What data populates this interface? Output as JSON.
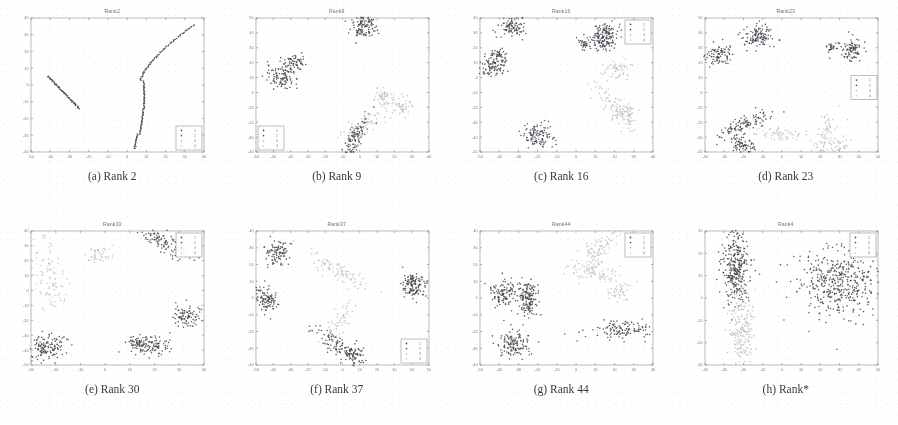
{
  "figure": {
    "background_color": "#ffffff",
    "grid_rows": 2,
    "grid_cols": 4,
    "caption_font_color": "#3a3a3a"
  },
  "style": {
    "axis_color": "#6f6f6f",
    "tick_label_color": "#5a5a5a",
    "legend_border_color": "#7a7a7a",
    "class_colors": [
      "#4a4a52",
      "#555560",
      "#b9b9bd",
      "#cfcfd3"
    ],
    "dark_color": "#4a4a52",
    "light_color": "#c2c2c6"
  },
  "legend": {
    "entries": [
      {
        "label": "1",
        "color": "#4a4a52",
        "marker": "dot"
      },
      {
        "label": "2",
        "color": "#555560",
        "marker": "dot"
      },
      {
        "label": "3",
        "color": "#b9b9bd",
        "marker": "dot"
      },
      {
        "label": "4",
        "color": "#cfcfd3",
        "marker": "dot"
      }
    ]
  },
  "chart_data": [
    {
      "id": "rank2",
      "type": "scatter",
      "title": "Rank2",
      "caption": "(a) Rank 2",
      "caption_index": "(a)",
      "caption_label": "Rank 2",
      "xlabel": "",
      "ylabel": "",
      "xlim": [
        -50,
        40
      ],
      "ylim": [
        -40,
        40
      ],
      "xticks": [
        -50,
        -40,
        -30,
        -20,
        -10,
        0,
        10,
        20,
        30,
        40
      ],
      "yticks": [
        -40,
        -30,
        -20,
        -10,
        0,
        10,
        20,
        30,
        40
      ],
      "grid": false,
      "legend_position": "lower-right",
      "legend_labels": [
        "1",
        "2",
        "3",
        "4"
      ],
      "clusters": [
        {
          "name": "line-left",
          "color": "#4a4a52",
          "shape": "line",
          "x": -41,
          "y": 5,
          "x2": -25,
          "y2": -14,
          "n": 60,
          "spread": 0.7
        },
        {
          "name": "curve-right",
          "color": "#4a4a52",
          "shape": "curve",
          "x": 5,
          "y": -38,
          "n": 150,
          "spread": 0.8
        }
      ]
    },
    {
      "id": "rank9",
      "type": "scatter",
      "title": "Rank9",
      "caption": "(b) Rank 9",
      "caption_index": "(b)",
      "caption_label": "Rank 9",
      "xlabel": "",
      "ylabel": "",
      "xlim": [
        -60,
        40
      ],
      "ylim": [
        -40,
        50
      ],
      "xticks": [
        -60,
        -50,
        -40,
        -30,
        -20,
        -10,
        0,
        10,
        20,
        30,
        40
      ],
      "yticks": [
        -40,
        -30,
        -20,
        -10,
        0,
        10,
        20,
        30,
        40,
        50
      ],
      "grid": false,
      "legend_position": "lower-left",
      "legend_labels": [
        "1",
        "2",
        "3",
        "4"
      ],
      "clusters": [
        {
          "name": "top-right-dark",
          "color": "#4a4a52",
          "shape": "blob",
          "x": 3,
          "y": 44,
          "n": 110,
          "spread": 4.0
        },
        {
          "name": "mid-left-dark",
          "color": "#4a4a52",
          "shape": "blob",
          "x": -45,
          "y": 11,
          "n": 110,
          "spread": 4.5
        },
        {
          "name": "mid-left-dark-2",
          "color": "#4a4a52",
          "shape": "blob",
          "x": -37,
          "y": 20,
          "n": 55,
          "spread": 2.6
        },
        {
          "name": "right-light",
          "color": "#c2c2c6",
          "shape": "blob",
          "x": 14,
          "y": -4,
          "n": 55,
          "spread": 3.2
        },
        {
          "name": "right-light-2",
          "color": "#c2c2c6",
          "shape": "blob",
          "x": 24,
          "y": -9,
          "n": 45,
          "spread": 3.0
        },
        {
          "name": "bottom-light",
          "color": "#c2c2c6",
          "shape": "streak",
          "x": 2,
          "y": -22,
          "n": 70,
          "spread": 4.5
        },
        {
          "name": "bottom-dark",
          "color": "#4a4a52",
          "shape": "streak",
          "x": -4,
          "y": -34,
          "n": 120,
          "spread": 4.5
        }
      ]
    },
    {
      "id": "rank16",
      "type": "scatter",
      "title": "Rank16",
      "caption": "(c) Rank 16",
      "caption_index": "(c)",
      "caption_label": "Rank 16",
      "xlabel": "",
      "ylabel": "",
      "xlim": [
        -50,
        40
      ],
      "ylim": [
        -50,
        40
      ],
      "xticks": [
        -50,
        -40,
        -30,
        -20,
        -10,
        0,
        10,
        20,
        30,
        40
      ],
      "yticks": [
        -50,
        -40,
        -30,
        -20,
        -10,
        0,
        10,
        20,
        30,
        40
      ],
      "grid": false,
      "legend_position": "upper-right",
      "legend_labels": [
        "1",
        "2",
        "3",
        "4"
      ],
      "clusters": [
        {
          "name": "top-left-dark",
          "color": "#4a4a52",
          "shape": "blob",
          "x": -34,
          "y": 34,
          "n": 90,
          "spread": 3.4
        },
        {
          "name": "left-dark",
          "color": "#4a4a52",
          "shape": "blob",
          "x": -43,
          "y": 8,
          "n": 95,
          "spread": 3.6
        },
        {
          "name": "left-dark-2",
          "color": "#4a4a52",
          "shape": "blob",
          "x": -41,
          "y": 16,
          "n": 35,
          "spread": 2.0
        },
        {
          "name": "bottom-dark",
          "color": "#4a4a52",
          "shape": "blob",
          "x": -20,
          "y": -39,
          "n": 110,
          "spread": 3.8
        },
        {
          "name": "right-dark",
          "color": "#4a4a52",
          "shape": "blob",
          "x": 16,
          "y": 30,
          "n": 90,
          "spread": 3.4
        },
        {
          "name": "right-dark-2",
          "color": "#4a4a52",
          "shape": "blob",
          "x": 14,
          "y": 24,
          "n": 70,
          "spread": 3.0
        },
        {
          "name": "right-dark-3",
          "color": "#4a4a52",
          "shape": "blob",
          "x": 4,
          "y": 23,
          "n": 35,
          "spread": 2.0
        },
        {
          "name": "right-light",
          "color": "#c2c2c6",
          "shape": "blob",
          "x": 22,
          "y": 5,
          "n": 55,
          "spread": 3.4
        },
        {
          "name": "mid-light",
          "color": "#c2c2c6",
          "shape": "streak",
          "x": 20,
          "y": -20,
          "n": 80,
          "spread": 5.0
        },
        {
          "name": "mid-light-2",
          "color": "#c2c2c6",
          "shape": "blob",
          "x": 26,
          "y": -25,
          "n": 50,
          "spread": 3.2
        }
      ]
    },
    {
      "id": "rank23",
      "type": "scatter",
      "title": "Rank23",
      "caption": "(d) Rank 23",
      "caption_index": "(d)",
      "caption_label": "Rank 23",
      "xlabel": "",
      "ylabel": "",
      "xlim": [
        -40,
        50
      ],
      "ylim": [
        -40,
        50
      ],
      "xticks": [
        -40,
        -30,
        -20,
        -10,
        0,
        10,
        20,
        30,
        40,
        50
      ],
      "yticks": [
        -40,
        -30,
        -20,
        -10,
        0,
        10,
        20,
        30,
        40,
        50
      ],
      "grid": false,
      "legend_position": "right-middle",
      "legend_labels": [
        "1",
        "2",
        "3",
        "4"
      ],
      "clusters": [
        {
          "name": "top-mid-dark",
          "color": "#4a4a52",
          "shape": "blob",
          "x": -12,
          "y": 38,
          "n": 120,
          "spread": 4.0
        },
        {
          "name": "left-dark",
          "color": "#4a4a52",
          "shape": "blob",
          "x": -33,
          "y": 25,
          "n": 85,
          "spread": 3.6
        },
        {
          "name": "right-dark",
          "color": "#4a4a52",
          "shape": "blob",
          "x": 36,
          "y": 29,
          "n": 90,
          "spread": 3.6
        },
        {
          "name": "right-dark-2",
          "color": "#4a4a52",
          "shape": "blob",
          "x": 26,
          "y": 31,
          "n": 22,
          "spread": 1.5
        },
        {
          "name": "bottom-dark",
          "color": "#4a4a52",
          "shape": "streak",
          "x": -20,
          "y": -22,
          "n": 110,
          "spread": 4.5
        },
        {
          "name": "bottom-dark-2",
          "color": "#4a4a52",
          "shape": "blob",
          "x": -20,
          "y": -36,
          "n": 70,
          "spread": 3.0
        },
        {
          "name": "bottom-light",
          "color": "#c2c2c6",
          "shape": "streak",
          "x": -2,
          "y": -28,
          "n": 60,
          "spread": 4.0
        },
        {
          "name": "bottom-light-2",
          "color": "#c2c2c6",
          "shape": "streak",
          "x": 22,
          "y": -30,
          "n": 70,
          "spread": 4.5
        },
        {
          "name": "bottom-light-3",
          "color": "#c2c2c6",
          "shape": "blob",
          "x": 30,
          "y": -36,
          "n": 45,
          "spread": 3.0
        }
      ]
    },
    {
      "id": "rank30",
      "type": "scatter",
      "title": "Rank30",
      "caption": "(e) Rank 30",
      "caption_index": "(e)",
      "caption_label": "Rank 30",
      "xlabel": "",
      "ylabel": "",
      "xlim": [
        -30,
        40
      ],
      "ylim": [
        -50,
        40
      ],
      "xticks": [
        -30,
        -20,
        -10,
        0,
        10,
        20,
        30,
        40
      ],
      "yticks": [
        -50,
        -40,
        -30,
        -20,
        -10,
        0,
        10,
        20,
        30,
        40
      ],
      "grid": false,
      "legend_position": "upper-right",
      "legend_labels": [
        "1",
        "2",
        "3",
        "4"
      ],
      "clusters": [
        {
          "name": "top-right-dark",
          "color": "#4a4a52",
          "shape": "streak",
          "x": 24,
          "y": 32,
          "n": 120,
          "spread": 4.5
        },
        {
          "name": "top-light",
          "color": "#c2c2c6",
          "shape": "blob",
          "x": -2,
          "y": 24,
          "n": 45,
          "spread": 3.0
        },
        {
          "name": "left-light",
          "color": "#c2c2c6",
          "shape": "streak",
          "x": -22,
          "y": 10,
          "n": 90,
          "spread": 5.5
        },
        {
          "name": "right-dark",
          "color": "#4a4a52",
          "shape": "blob",
          "x": 33,
          "y": -17,
          "n": 90,
          "spread": 3.4
        },
        {
          "name": "bottom-left-dark",
          "color": "#4a4a52",
          "shape": "blob",
          "x": -24,
          "y": -38,
          "n": 130,
          "spread": 4.0
        },
        {
          "name": "bottom-mid-dark",
          "color": "#4a4a52",
          "shape": "blob",
          "x": 13,
          "y": -36,
          "n": 60,
          "spread": 2.6
        },
        {
          "name": "bottom-mid-dark-2",
          "color": "#4a4a52",
          "shape": "blob",
          "x": 20,
          "y": -37,
          "n": 80,
          "spread": 3.2
        }
      ]
    },
    {
      "id": "rank37",
      "type": "scatter",
      "title": "Rank37",
      "caption": "(f) Rank 37",
      "caption_index": "(f)",
      "caption_label": "Rank 37",
      "xlabel": "",
      "ylabel": "",
      "xlim": [
        -50,
        50
      ],
      "ylim": [
        -40,
        40
      ],
      "xticks": [
        -50,
        -40,
        -30,
        -20,
        -10,
        0,
        10,
        20,
        30,
        40,
        50
      ],
      "yticks": [
        -40,
        -30,
        -20,
        -10,
        0,
        10,
        20,
        30,
        40
      ],
      "grid": false,
      "legend_position": "lower-right",
      "legend_labels": [
        "1",
        "2",
        "3",
        "4"
      ],
      "clusters": [
        {
          "name": "top-left-dark",
          "color": "#4a4a52",
          "shape": "blob",
          "x": -38,
          "y": 27,
          "n": 95,
          "spread": 3.4
        },
        {
          "name": "left-dark",
          "color": "#4a4a52",
          "shape": "blob",
          "x": -44,
          "y": -1,
          "n": 100,
          "spread": 3.6
        },
        {
          "name": "right-dark",
          "color": "#4a4a52",
          "shape": "blob",
          "x": 42,
          "y": 6,
          "n": 100,
          "spread": 3.6
        },
        {
          "name": "right-dark-2",
          "color": "#4a4a52",
          "shape": "blob",
          "x": 40,
          "y": 11,
          "n": 30,
          "spread": 1.8
        },
        {
          "name": "center-light",
          "color": "#c2c2c6",
          "shape": "streak",
          "x": -2,
          "y": 16,
          "n": 90,
          "spread": 5.0
        },
        {
          "name": "center-light-2",
          "color": "#c2c2c6",
          "shape": "streak",
          "x": 0,
          "y": -12,
          "n": 55,
          "spread": 4.0
        },
        {
          "name": "bottom-dark",
          "color": "#4a4a52",
          "shape": "streak",
          "x": -3,
          "y": -29,
          "n": 100,
          "spread": 4.5
        },
        {
          "name": "bottom-dark-2",
          "color": "#4a4a52",
          "shape": "blob",
          "x": 8,
          "y": -33,
          "n": 55,
          "spread": 2.8
        }
      ]
    },
    {
      "id": "rank44",
      "type": "scatter",
      "title": "Rank44",
      "caption": "(g) Rank 44",
      "caption_index": "(g)",
      "caption_label": "Rank 44",
      "xlabel": "",
      "ylabel": "",
      "xlim": [
        -50,
        40
      ],
      "ylim": [
        -40,
        40
      ],
      "xticks": [
        -50,
        -40,
        -30,
        -20,
        -10,
        0,
        10,
        20,
        30,
        40
      ],
      "yticks": [
        -40,
        -30,
        -20,
        -10,
        0,
        10,
        20,
        30,
        40
      ],
      "grid": false,
      "legend_position": "upper-right",
      "legend_labels": [
        "1",
        "2",
        "3",
        "4"
      ],
      "clusters": [
        {
          "name": "left-dark",
          "color": "#4a4a52",
          "shape": "blob",
          "x": -38,
          "y": 3,
          "n": 110,
          "spread": 3.8
        },
        {
          "name": "mid-dark",
          "color": "#4a4a52",
          "shape": "blob",
          "x": -26,
          "y": 3,
          "n": 95,
          "spread": 3.4
        },
        {
          "name": "mid-dark-2",
          "color": "#4a4a52",
          "shape": "blob",
          "x": -25,
          "y": -6,
          "n": 55,
          "spread": 2.6
        },
        {
          "name": "bottom-left-dark",
          "color": "#4a4a52",
          "shape": "blob",
          "x": -32,
          "y": -27,
          "n": 130,
          "spread": 4.2
        },
        {
          "name": "top-light",
          "color": "#c2c2c6",
          "shape": "streak",
          "x": 12,
          "y": 30,
          "n": 110,
          "spread": 5.5
        },
        {
          "name": "mid-light",
          "color": "#c2c2c6",
          "shape": "streak",
          "x": 8,
          "y": 16,
          "n": 70,
          "spread": 4.0
        },
        {
          "name": "right-light",
          "color": "#c2c2c6",
          "shape": "blob",
          "x": 22,
          "y": 3,
          "n": 45,
          "spread": 3.0
        },
        {
          "name": "right-dark",
          "color": "#4a4a52",
          "shape": "streak",
          "x": 24,
          "y": -19,
          "n": 120,
          "spread": 5.0
        }
      ]
    },
    {
      "id": "rankstar",
      "type": "scatter",
      "title": "Rank4",
      "caption": "(h) Rank*",
      "caption_index": "(h)",
      "caption_label": "Rank*",
      "xlabel": "",
      "ylabel": "",
      "xlim": [
        -40,
        50
      ],
      "ylim": [
        -30,
        30
      ],
      "xticks": [
        -40,
        -30,
        -20,
        -10,
        0,
        10,
        20,
        30,
        40,
        50
      ],
      "yticks": [
        -30,
        -20,
        -10,
        0,
        10,
        20,
        30
      ],
      "grid": false,
      "legend_position": "upper-right",
      "legend_labels": [
        "1",
        "2",
        "3",
        "4"
      ],
      "clusters": [
        {
          "name": "left-dark",
          "color": "#4a4a52",
          "shape": "tall",
          "x": -24,
          "y": 14,
          "n": 320,
          "spread": 5.5
        },
        {
          "name": "right-dark",
          "color": "#4a4a52",
          "shape": "wide",
          "x": 30,
          "y": 7,
          "n": 420,
          "spread": 7.5
        },
        {
          "name": "bottom-light",
          "color": "#c2c2c6",
          "shape": "tall",
          "x": -21,
          "y": -16,
          "n": 200,
          "spread": 5.5
        }
      ]
    }
  ]
}
